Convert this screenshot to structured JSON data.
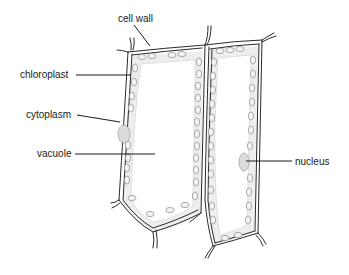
{
  "diagram": {
    "labels": {
      "cell_wall": "cell wall",
      "chloroplast": "chloroplast",
      "cytoplasm": "cytoplasm",
      "vacuole": "vacuole",
      "nucleus": "nucleus"
    },
    "colors": {
      "wall": "#2a2a2a",
      "cytoplasm": "#eeeeee",
      "chloroplast_outline": "#8a8a8a",
      "nucleus": "#dcdcdc",
      "text": "#1a1a1a"
    }
  }
}
